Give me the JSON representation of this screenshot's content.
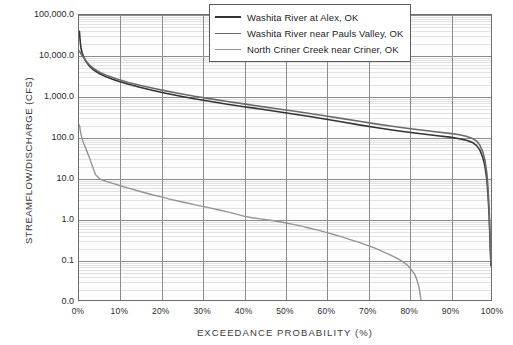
{
  "chart_data": {
    "type": "line",
    "title": "",
    "xlabel": "Exceedance Probability (%)",
    "ylabel": "Streamflow/Discharge (cfs)",
    "ylabel_main": "Streamflow/Discharge",
    "ylabel_unit": "(cfs)",
    "scale": {
      "x": "linear",
      "y": "log"
    },
    "xlim": [
      0,
      100
    ],
    "ylim": [
      0.01,
      100000
    ],
    "grid": "major vertical at every 10%, major horizontal at every decade, minor horizontal log subdivisions",
    "legend_position": "top-right inside plot",
    "y_ticks": [
      {
        "label": "100,000.0",
        "value": 100000
      },
      {
        "label": "10,000.0",
        "value": 10000
      },
      {
        "label": "1,000.0",
        "value": 1000
      },
      {
        "label": "100.0",
        "value": 100
      },
      {
        "label": "10.0",
        "value": 10
      },
      {
        "label": "1.0",
        "value": 1
      },
      {
        "label": "0.1",
        "value": 0.1
      },
      {
        "label": "0.0",
        "value": 0.01
      }
    ],
    "x_ticks": [
      {
        "label": "0%",
        "value": 0
      },
      {
        "label": "10%",
        "value": 10
      },
      {
        "label": "20%",
        "value": 20
      },
      {
        "label": "30%",
        "value": 30
      },
      {
        "label": "40%",
        "value": 40
      },
      {
        "label": "50%",
        "value": 50
      },
      {
        "label": "60%",
        "value": 60
      },
      {
        "label": "70%",
        "value": 70
      },
      {
        "label": "80%",
        "value": 80
      },
      {
        "label": "90%",
        "value": 90
      },
      {
        "label": "100%",
        "value": 100
      }
    ],
    "series": [
      {
        "name": "Washita River at Alex, OK",
        "color": "#333333",
        "width": 1.6,
        "points": [
          [
            0.1,
            40000
          ],
          [
            0.3,
            22000
          ],
          [
            0.5,
            15000
          ],
          [
            0.8,
            11500
          ],
          [
            1.2,
            9000
          ],
          [
            1.8,
            7000
          ],
          [
            2.5,
            5600
          ],
          [
            3.5,
            4500
          ],
          [
            5,
            3600
          ],
          [
            7,
            2900
          ],
          [
            9,
            2450
          ],
          [
            12,
            2000
          ],
          [
            15,
            1650
          ],
          [
            18,
            1400
          ],
          [
            21,
            1200
          ],
          [
            25,
            1000
          ],
          [
            28,
            880
          ],
          [
            32,
            750
          ],
          [
            36,
            640
          ],
          [
            40,
            560
          ],
          [
            44,
            490
          ],
          [
            48,
            425
          ],
          [
            52,
            370
          ],
          [
            56,
            320
          ],
          [
            60,
            275
          ],
          [
            64,
            235
          ],
          [
            68,
            200
          ],
          [
            72,
            172
          ],
          [
            76,
            150
          ],
          [
            80,
            132
          ],
          [
            84,
            118
          ],
          [
            87,
            108
          ],
          [
            90,
            100
          ],
          [
            92,
            93
          ],
          [
            94,
            84
          ],
          [
            95.5,
            74
          ],
          [
            96.5,
            62
          ],
          [
            97.3,
            48
          ],
          [
            98,
            32
          ],
          [
            98.5,
            20
          ],
          [
            99,
            9
          ],
          [
            99.3,
            3.5
          ],
          [
            99.55,
            1.2
          ],
          [
            99.7,
            0.45
          ],
          [
            99.82,
            0.2
          ],
          [
            99.9,
            0.12
          ],
          [
            99.96,
            0.085
          ],
          [
            100,
            0.07
          ]
        ]
      },
      {
        "name": "Washita River near Pauls Valley, OK",
        "color": "#6b6b6b",
        "width": 1.6,
        "points": [
          [
            0.1,
            13000
          ],
          [
            0.3,
            12000
          ],
          [
            0.5,
            11000
          ],
          [
            0.8,
            10000
          ],
          [
            1.2,
            8800
          ],
          [
            1.8,
            7200
          ],
          [
            2.5,
            6000
          ],
          [
            3.5,
            4900
          ],
          [
            5,
            3950
          ],
          [
            7,
            3200
          ],
          [
            9,
            2700
          ],
          [
            12,
            2200
          ],
          [
            15,
            1850
          ],
          [
            18,
            1580
          ],
          [
            21,
            1370
          ],
          [
            25,
            1150
          ],
          [
            28,
            1010
          ],
          [
            32,
            870
          ],
          [
            36,
            750
          ],
          [
            40,
            655
          ],
          [
            44,
            570
          ],
          [
            48,
            500
          ],
          [
            52,
            440
          ],
          [
            56,
            380
          ],
          [
            60,
            330
          ],
          [
            64,
            285
          ],
          [
            68,
            245
          ],
          [
            72,
            212
          ],
          [
            76,
            185
          ],
          [
            80,
            163
          ],
          [
            84,
            146
          ],
          [
            87,
            134
          ],
          [
            90,
            124
          ],
          [
            92,
            116
          ],
          [
            94,
            105
          ],
          [
            95.5,
            93
          ],
          [
            96.5,
            80
          ],
          [
            97.3,
            63
          ],
          [
            98,
            44
          ],
          [
            98.5,
            28
          ],
          [
            99,
            13
          ],
          [
            99.3,
            5
          ],
          [
            99.55,
            1.7
          ],
          [
            99.7,
            0.6
          ],
          [
            99.82,
            0.26
          ],
          [
            99.9,
            0.15
          ],
          [
            99.96,
            0.1
          ],
          [
            100,
            0.08
          ]
        ]
      },
      {
        "name": "North Criner Creek near Criner, OK",
        "color": "#949494",
        "width": 1.4,
        "points": [
          [
            0.1,
            200
          ],
          [
            0.3,
            150
          ],
          [
            0.5,
            115
          ],
          [
            0.8,
            88
          ],
          [
            1.2,
            68
          ],
          [
            1.8,
            48
          ],
          [
            2.5,
            32
          ],
          [
            3.2,
            20
          ],
          [
            4,
            12
          ],
          [
            5,
            9.5
          ],
          [
            6,
            8.6
          ],
          [
            7,
            8.0
          ],
          [
            8,
            7.4
          ],
          [
            9,
            6.9
          ],
          [
            10,
            6.4
          ],
          [
            12,
            5.6
          ],
          [
            14,
            4.9
          ],
          [
            16,
            4.3
          ],
          [
            18,
            3.8
          ],
          [
            20,
            3.4
          ],
          [
            22,
            3.0
          ],
          [
            24,
            2.7
          ],
          [
            26,
            2.45
          ],
          [
            28,
            2.2
          ],
          [
            30,
            2.0
          ],
          [
            32,
            1.8
          ],
          [
            34,
            1.62
          ],
          [
            36,
            1.46
          ],
          [
            38,
            1.3
          ],
          [
            40,
            1.15
          ],
          [
            42,
            1.05
          ],
          [
            44,
            0.98
          ],
          [
            46,
            0.92
          ],
          [
            48,
            0.86
          ],
          [
            50,
            0.79
          ],
          [
            52,
            0.72
          ],
          [
            54,
            0.65
          ],
          [
            56,
            0.58
          ],
          [
            58,
            0.52
          ],
          [
            60,
            0.46
          ],
          [
            62,
            0.4
          ],
          [
            64,
            0.35
          ],
          [
            66,
            0.3
          ],
          [
            68,
            0.26
          ],
          [
            70,
            0.22
          ],
          [
            72,
            0.185
          ],
          [
            74,
            0.15
          ],
          [
            75.5,
            0.128
          ],
          [
            77,
            0.108
          ],
          [
            78,
            0.095
          ],
          [
            79,
            0.082
          ],
          [
            79.8,
            0.07
          ],
          [
            80.4,
            0.06
          ],
          [
            81,
            0.05
          ],
          [
            81.5,
            0.042
          ],
          [
            81.9,
            0.034
          ],
          [
            82.2,
            0.027
          ],
          [
            82.5,
            0.021
          ],
          [
            82.7,
            0.016
          ],
          [
            82.9,
            0.012
          ],
          [
            83,
            0.01
          ]
        ]
      }
    ]
  },
  "legend": {
    "entries": [
      {
        "label": "Washita River at Alex, OK",
        "color": "#333333"
      },
      {
        "label": "Washita River near Pauls Valley, OK",
        "color": "#6b6b6b"
      },
      {
        "label": "North Criner Creek near Criner, OK",
        "color": "#949494"
      }
    ]
  }
}
